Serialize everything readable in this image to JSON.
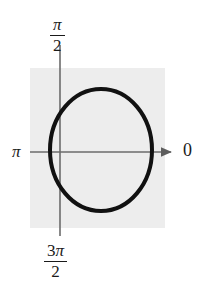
{
  "figure": {
    "title": "",
    "background_color": "#ffffff",
    "panel_color": "#ededed",
    "curve_color": "#111111",
    "axis_color": "#6b6b6b",
    "label_color": "#1a1a1a"
  },
  "labels": {
    "right": "0",
    "left": "π",
    "top_numerator": "π",
    "top_denominator": "2",
    "bottom_coefficient": "3",
    "bottom_numerator": "π",
    "bottom_denominator": "2"
  },
  "chart_data": {
    "type": "line",
    "title": "",
    "xlabel": "",
    "ylabel": "",
    "grid": false,
    "legend_position": "none",
    "coordinate_system": "polar",
    "angle_tick_labels": [
      "0",
      "π/2",
      "π",
      "3π/2"
    ],
    "angle_tick_positions_deg": [
      0,
      90,
      180,
      270
    ],
    "axis_arrow_direction": "right",
    "series": [
      {
        "name": "closed oval curve",
        "closed": true,
        "center": [
          101,
          150
        ],
        "radius_x": 51,
        "radius_y": 61,
        "stroke_width": 4,
        "points_deg": [
          [
            0,
            51
          ],
          [
            15,
            51
          ],
          [
            30,
            52
          ],
          [
            45,
            53
          ],
          [
            60,
            54
          ],
          [
            75,
            55
          ],
          [
            90,
            61
          ],
          [
            105,
            58
          ],
          [
            120,
            56
          ],
          [
            135,
            54
          ],
          [
            150,
            52
          ],
          [
            165,
            51
          ],
          [
            180,
            51
          ],
          [
            195,
            51
          ],
          [
            210,
            52
          ],
          [
            225,
            54
          ],
          [
            240,
            56
          ],
          [
            255,
            58
          ],
          [
            270,
            61
          ],
          [
            285,
            55
          ],
          [
            300,
            54
          ],
          [
            315,
            53
          ],
          [
            330,
            52
          ],
          [
            345,
            51
          ]
        ]
      }
    ],
    "panel_extent": {
      "x0": 30,
      "y0": 68,
      "x1": 165,
      "y1": 228
    },
    "horizontal_axis": {
      "y": 152,
      "x_start": 30,
      "x_end": 175
    },
    "vertical_axis": {
      "x": 60,
      "y_start": 45,
      "y_end": 236
    }
  }
}
